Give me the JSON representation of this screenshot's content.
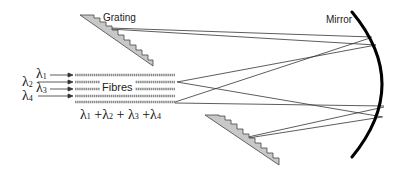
{
  "diagram": {
    "type": "optical spectrograph schematic",
    "labels": {
      "grating": "Grating",
      "mirror": "Mirror",
      "fibres": "Fibres"
    },
    "inputs": [
      {
        "symbol": "λ",
        "sub": "1"
      },
      {
        "symbol": "λ",
        "sub": "2"
      },
      {
        "symbol": "λ",
        "sub": "3"
      },
      {
        "symbol": "λ",
        "sub": "4"
      }
    ],
    "sum_label": {
      "terms": [
        "λ1",
        "λ2",
        "λ3",
        "λ4"
      ],
      "text": "λ1 + λ2 + λ3 + λ4"
    },
    "components": [
      "upper grating",
      "lower grating",
      "fibre bundle",
      "curved mirror"
    ],
    "colors": {
      "lines": "#333333",
      "grating_fill": "#c8c8c8",
      "fibre": "#8a8a8a",
      "mirror": "#000000"
    }
  }
}
